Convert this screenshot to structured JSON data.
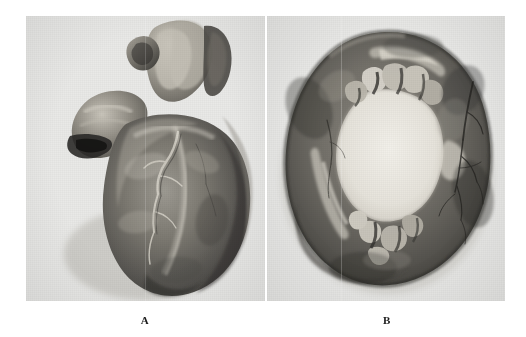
{
  "figure": {
    "domain": "natural-image",
    "medium": "black-and-white gross pathology photograph plate",
    "background_color": "#ffffff",
    "plate_color": "#e9e9e7",
    "panel_count": 2
  },
  "panels": [
    {
      "id": "A",
      "label": "A",
      "position": "left",
      "subject": "whole heart specimen, anterior view",
      "description": "Markedly enlarged heart viewed from the front; great vessels and atrial appendage at the superior pole, broad conical ventricular mass below, apex directed inferiorly. Epicardial coronary arteries visible as pale branching cords over the anterior surface.",
      "tone_range": {
        "darkest": "#2e2e2c",
        "midtone": "#6f6f6b",
        "highlight": "#d8d5cd"
      }
    },
    {
      "id": "B",
      "label": "B",
      "position": "right",
      "subject": "transverse cross-section of the ventricles",
      "description": "Transverse slice through the ventricles showing a greatly dilated, roughly ovoid central chamber surrounded by a thick myocardial ring. Pale fibrous/endocardial areas line parts of the cavity; trabeculae and papillary stumps project into the lumen superiorly and inferiorly. Coronary branches appear as dark lines on the right outer wall.",
      "tone_range": {
        "darkest": "#2a2a28",
        "midtone": "#6b6b67",
        "highlight": "#e0ded6"
      }
    }
  ],
  "labels": {
    "a": "A",
    "b": "B"
  }
}
